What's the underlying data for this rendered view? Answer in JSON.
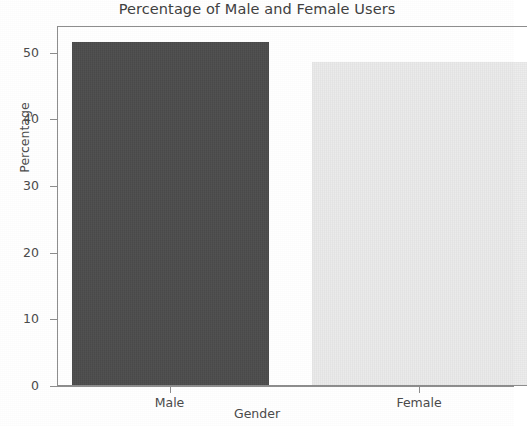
{
  "chart_data": {
    "type": "bar",
    "title": "Percentage of Male and Female Users",
    "xlabel": "Gender",
    "ylabel": "Percentage",
    "categories": [
      "Male",
      "Female"
    ],
    "values": [
      51.5,
      48.5
    ],
    "series": [
      {
        "name": "Percentage",
        "values": [
          51.5,
          48.5
        ]
      }
    ],
    "bar_colors": [
      "#4c4c4c",
      "#ececec"
    ],
    "ylim": [
      0,
      54
    ],
    "yticks": [
      0,
      10,
      20,
      30,
      40,
      50
    ],
    "ytick_labels": [
      "0",
      "10",
      "20",
      "30",
      "40",
      "50"
    ],
    "xticks": [
      "Male",
      "Female"
    ],
    "grid": false,
    "legend": "none"
  },
  "figure": {
    "background": "#ffffff",
    "spine_color": "#8d8d8d",
    "text_color": "#4a4a4a"
  }
}
